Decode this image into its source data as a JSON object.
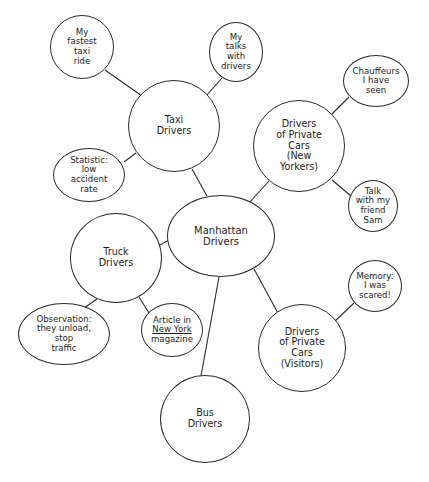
{
  "diagram": {
    "type": "mind-map",
    "background_color": "#fefefe",
    "stroke_color": "#2b2b2b",
    "text_color": "#1d1d1d",
    "nodes": [
      {
        "id": "manhattan-drivers",
        "label": "Manhattan\nDrivers",
        "role": "central",
        "cx": 221,
        "cy": 236,
        "rx": 54,
        "ry": 41
      },
      {
        "id": "taxi-drivers",
        "label": "Taxi\nDrivers",
        "role": "main",
        "cx": 174,
        "cy": 126,
        "rx": 46,
        "ry": 46
      },
      {
        "id": "drivers-private-cars-new-yorkers",
        "label": "Drivers\nof Private\nCars\n(New\nYorkers)",
        "role": "main",
        "cx": 299,
        "cy": 146,
        "rx": 46,
        "ry": 46
      },
      {
        "id": "truck-drivers",
        "label": "Truck\nDrivers",
        "role": "main",
        "cx": 116,
        "cy": 258,
        "rx": 46,
        "ry": 45
      },
      {
        "id": "drivers-private-cars-visitors",
        "label": "Drivers\nof Private\nCars\n(Visitors)",
        "role": "main",
        "cx": 302,
        "cy": 348,
        "rx": 44,
        "ry": 44
      },
      {
        "id": "bus-drivers",
        "label": "Bus\nDrivers",
        "role": "main",
        "cx": 205,
        "cy": 419,
        "rx": 45,
        "ry": 44
      },
      {
        "id": "my-fastest-taxi-ride",
        "label": "My\nfastest\ntaxi\nride",
        "role": "leaf",
        "cx": 82,
        "cy": 47,
        "rx": 32,
        "ry": 32
      },
      {
        "id": "my-talks-with-drivers",
        "label": "My\ntalks\nwith\ndrivers",
        "role": "leaf",
        "cx": 236,
        "cy": 52,
        "rx": 27,
        "ry": 30
      },
      {
        "id": "chauffeurs-i-have-seen",
        "label": "Chauffeurs\nI have\nseen",
        "role": "leaf",
        "cx": 376,
        "cy": 81,
        "rx": 33,
        "ry": 26
      },
      {
        "id": "statistic-low-accident-rate",
        "label": "Statistic:\nlow\naccident\nrate",
        "role": "leaf",
        "cx": 89,
        "cy": 175,
        "rx": 36,
        "ry": 27
      },
      {
        "id": "talk-with-my-friend-sam",
        "label": "Talk\nwith my\nfriend\nSam",
        "role": "leaf",
        "cx": 373,
        "cy": 206,
        "rx": 25,
        "ry": 26
      },
      {
        "id": "memory-i-was-scared",
        "label": "Memory:\nI was\nscared!",
        "role": "leaf",
        "cx": 375,
        "cy": 286,
        "rx": 27,
        "ry": 26
      },
      {
        "id": "observation-they-unload-stop-traffic",
        "label": "Observation:\nthey unload,\nstop\ntraffic",
        "role": "leaf",
        "cx": 64,
        "cy": 334,
        "rx": 46,
        "ry": 31
      },
      {
        "id": "article-in-new-york-magazine",
        "label": "Article in\nNew York\nmagazine",
        "label_html": "Article in<br><span class=\"underline-em\">New York</span><br>magazine",
        "role": "leaf",
        "cx": 172,
        "cy": 330,
        "rx": 31,
        "ry": 27
      }
    ],
    "edges": [
      {
        "from": "my-fastest-taxi-ride",
        "to": "taxi-drivers",
        "x1": 105,
        "y1": 70,
        "x2": 142,
        "y2": 96
      },
      {
        "from": "my-talks-with-drivers",
        "to": "taxi-drivers",
        "x1": 222,
        "y1": 78,
        "x2": 206,
        "y2": 96
      },
      {
        "from": "statistic-low-accident-rate",
        "to": "taxi-drivers",
        "x1": 124,
        "y1": 162,
        "x2": 136,
        "y2": 153
      },
      {
        "from": "taxi-drivers",
        "to": "manhattan-drivers",
        "x1": 192,
        "y1": 169,
        "x2": 207,
        "y2": 196
      },
      {
        "from": "chauffeurs-i-have-seen",
        "to": "drivers-private-cars-new-yorkers",
        "x1": 349,
        "y1": 97,
        "x2": 330,
        "y2": 116
      },
      {
        "from": "drivers-private-cars-new-yorkers",
        "to": "manhattan-drivers",
        "x1": 269,
        "y1": 181,
        "x2": 248,
        "y2": 204
      },
      {
        "from": "talk-with-my-friend-sam",
        "to": "drivers-private-cars-new-yorkers",
        "x1": 351,
        "y1": 196,
        "x2": 332,
        "y2": 180
      },
      {
        "from": "truck-drivers",
        "to": "manhattan-drivers",
        "x1": 160,
        "y1": 245,
        "x2": 169,
        "y2": 240
      },
      {
        "from": "observation-they-unload-stop-traffic",
        "to": "truck-drivers",
        "x1": 84,
        "y1": 308,
        "x2": 97,
        "y2": 299
      },
      {
        "from": "article-in-new-york-magazine",
        "to": "truck-drivers",
        "x1": 149,
        "y1": 313,
        "x2": 139,
        "y2": 297
      },
      {
        "from": "manhattan-drivers",
        "to": "bus-drivers",
        "x1": 219,
        "y1": 277,
        "x2": 201,
        "y2": 376
      },
      {
        "from": "manhattan-drivers",
        "to": "drivers-private-cars-visitors",
        "x1": 254,
        "y1": 269,
        "x2": 279,
        "y2": 315
      },
      {
        "from": "memory-i-was-scared",
        "to": "drivers-private-cars-visitors",
        "x1": 354,
        "y1": 303,
        "x2": 334,
        "y2": 322
      }
    ]
  }
}
